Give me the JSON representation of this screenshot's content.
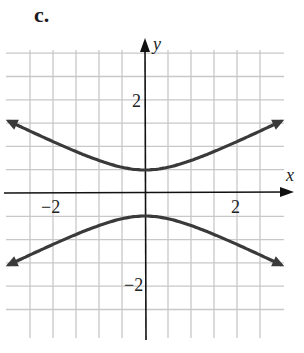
{
  "part_label": "c.",
  "chart_data": {
    "type": "line",
    "title": "",
    "xlabel": "x",
    "ylabel": "y",
    "xlim": [
      -3.1,
      3.1
    ],
    "ylim": [
      -3.2,
      3.2
    ],
    "grid": true,
    "grid_step": 0.5,
    "x_ticks": [
      {
        "value": -2,
        "label": "−2"
      },
      {
        "value": 2,
        "label": "2"
      }
    ],
    "y_ticks": [
      {
        "value": 2,
        "label": "2"
      },
      {
        "value": -2,
        "label": "−2"
      }
    ],
    "equation": "4y^2 - x^2 = 1",
    "series": [
      {
        "name": "upper branch",
        "x": [
          -3,
          -2,
          -1,
          0,
          1,
          2,
          3
        ],
        "y": [
          1.58,
          1.12,
          0.71,
          0.5,
          0.71,
          1.12,
          1.58
        ],
        "arrows": "both"
      },
      {
        "name": "lower branch",
        "x": [
          -3,
          -2,
          -1,
          0,
          1,
          2,
          3
        ],
        "y": [
          -1.58,
          -1.12,
          -0.71,
          -0.5,
          -0.71,
          -1.12,
          -1.58
        ],
        "arrows": "both"
      }
    ],
    "colors": {
      "curve": "#3a3a3a",
      "grid": "#c8c8c8",
      "axis": "#111111"
    }
  }
}
